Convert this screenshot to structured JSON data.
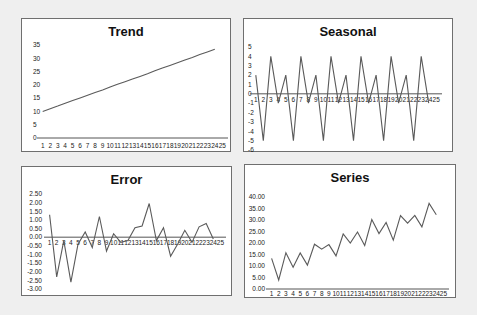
{
  "chart_data": [
    {
      "type": "line",
      "title": "Trend",
      "xlabel": "",
      "ylabel": "",
      "x": [
        1,
        2,
        3,
        4,
        5,
        6,
        7,
        8,
        9,
        10,
        11,
        12,
        13,
        14,
        15,
        16,
        17,
        18,
        19,
        20,
        21,
        22,
        23,
        24
      ],
      "x_ticks": [
        "1",
        "2",
        "3",
        "4",
        "5",
        "6",
        "7",
        "8",
        "9",
        "10",
        "11",
        "12",
        "13",
        "14",
        "15",
        "16",
        "17",
        "18",
        "19",
        "20",
        "21",
        "22",
        "23",
        "24",
        "25"
      ],
      "values": [
        10.0,
        11.0,
        12.0,
        13.1,
        14.1,
        15.1,
        16.1,
        17.1,
        18.1,
        19.2,
        20.2,
        21.2,
        22.2,
        23.2,
        24.2,
        25.3,
        26.3,
        27.3,
        28.3,
        29.3,
        30.3,
        31.4,
        32.4,
        33.4
      ],
      "y_ticks": [
        "0",
        "5",
        "10",
        "15",
        "20",
        "25",
        "30",
        "35"
      ],
      "ylim": [
        0,
        35
      ],
      "grid": false,
      "legend": "none"
    },
    {
      "type": "line",
      "title": "Seasonal",
      "xlabel": "",
      "ylabel": "",
      "x": [
        1,
        2,
        3,
        4,
        5,
        6,
        7,
        8,
        9,
        10,
        11,
        12,
        13,
        14,
        15,
        16,
        17,
        18,
        19,
        20,
        21,
        22,
        23,
        24
      ],
      "x_ticks": [
        "1",
        "2",
        "3",
        "4",
        "5",
        "6",
        "7",
        "8",
        "9",
        "10",
        "11",
        "12",
        "13",
        "14",
        "15",
        "16",
        "17",
        "18",
        "19",
        "20",
        "21",
        "22",
        "23",
        "24",
        "25"
      ],
      "values": [
        2,
        -5,
        4,
        -1,
        2,
        -5,
        4,
        -1,
        2,
        -5,
        4,
        -1,
        2,
        -5,
        4,
        -1,
        2,
        -5,
        4,
        -1,
        2,
        -5,
        4,
        -1
      ],
      "y_ticks": [
        "5",
        "4",
        "3",
        "2",
        "1",
        "0",
        "-1",
        "-2",
        "-3",
        "-4",
        "-5",
        "-6"
      ],
      "ylim": [
        -6,
        5
      ],
      "grid": false,
      "legend": "none"
    },
    {
      "type": "line",
      "title": "Error",
      "xlabel": "",
      "ylabel": "",
      "x": [
        1,
        2,
        3,
        4,
        5,
        6,
        7,
        8,
        9,
        10,
        11,
        12,
        13,
        14,
        15,
        16,
        17,
        18,
        19,
        20,
        21,
        22,
        23,
        24
      ],
      "x_ticks": [
        "1",
        "2",
        "3",
        "4",
        "5",
        "6",
        "7",
        "8",
        "9",
        "10",
        "11",
        "12",
        "13",
        "14",
        "15",
        "16",
        "17",
        "18",
        "19",
        "20",
        "21",
        "22",
        "23",
        "24",
        "25"
      ],
      "values": [
        1.3,
        -2.3,
        -0.2,
        -2.6,
        -0.4,
        0.3,
        -0.6,
        1.2,
        -0.8,
        0.2,
        -0.3,
        -0.2,
        0.55,
        0.65,
        1.95,
        -0.2,
        0.55,
        -1.1,
        -0.4,
        0.4,
        -0.3,
        0.6,
        0.8,
        -0.1
      ],
      "y_ticks": [
        "2.50",
        "2.00",
        "1.50",
        "1.00",
        "0.50",
        "0.00",
        "-0.50",
        "-1.00",
        "-1.50",
        "-2.00",
        "-2.50",
        "-3.00"
      ],
      "ylim": [
        -3,
        2.5
      ],
      "grid": false,
      "legend": "none"
    },
    {
      "type": "line",
      "title": "Series",
      "xlabel": "",
      "ylabel": "",
      "x": [
        1,
        2,
        3,
        4,
        5,
        6,
        7,
        8,
        9,
        10,
        11,
        12,
        13,
        14,
        15,
        16,
        17,
        18,
        19,
        20,
        21,
        22,
        23,
        24
      ],
      "x_ticks": [
        "1",
        "2",
        "3",
        "4",
        "5",
        "6",
        "7",
        "8",
        "9",
        "10",
        "11",
        "12",
        "13",
        "14",
        "15",
        "16",
        "17",
        "18",
        "19",
        "20",
        "21",
        "22",
        "23",
        "24",
        "25"
      ],
      "values": [
        13.3,
        3.9,
        15.8,
        9.5,
        15.7,
        10.4,
        19.5,
        17.3,
        19.3,
        14.4,
        23.9,
        20.0,
        24.8,
        18.9,
        30.2,
        24.1,
        28.9,
        21.2,
        31.9,
        28.6,
        32.0,
        27.0,
        37.2,
        32.3
      ],
      "y_ticks": [
        "0.00",
        "5.00",
        "10.00",
        "15.00",
        "20.00",
        "25.00",
        "30.00",
        "35.00",
        "40.00"
      ],
      "ylim": [
        0,
        40
      ],
      "grid": false,
      "legend": "none"
    }
  ],
  "panels": {
    "trend": {
      "title": "Trend"
    },
    "seasonal": {
      "title": "Seasonal"
    },
    "error": {
      "title": "Error"
    },
    "series": {
      "title": "Series"
    }
  },
  "colors": {
    "line": "#5a5a5a",
    "axis": "#555555",
    "background": "#efefef",
    "panel": "#ffffff"
  }
}
